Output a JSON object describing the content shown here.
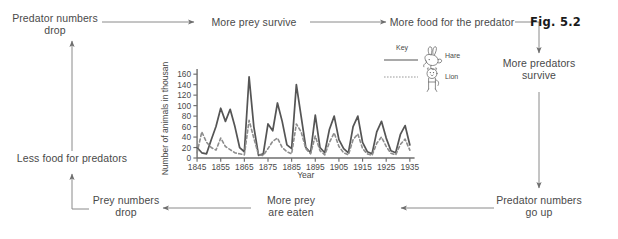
{
  "figure": {
    "label": "Fig. 5.2",
    "caption_type": "predator-prey-cycle-diagram"
  },
  "flow": {
    "nodes": [
      {
        "id": "predator-numbers-drop",
        "label": "Predator numbers\ndrop"
      },
      {
        "id": "more-prey-survive",
        "label": "More prey survive"
      },
      {
        "id": "more-food-for-predator",
        "label": "More food for the predator"
      },
      {
        "id": "more-predators-survive",
        "label": "More predators\nsurvive"
      },
      {
        "id": "predator-numbers-go-up",
        "label": "Predator numbers\ngo up"
      },
      {
        "id": "more-prey-are-eaten",
        "label": "More prey\nare eaten"
      },
      {
        "id": "prey-numbers-drop",
        "label": "Prey numbers\ndrop"
      },
      {
        "id": "less-food-for-predators",
        "label": "Less food for predators"
      }
    ]
  },
  "legend": {
    "title": "Key",
    "entries": [
      {
        "label": "Hare",
        "style": "solid",
        "icon": "hare-illustration",
        "color": "#555555"
      },
      {
        "label": "Lion",
        "style": "dotted",
        "icon": "lion-illustration",
        "color": "#8d8d8d"
      }
    ]
  },
  "chart_data": {
    "type": "line",
    "title": "",
    "xlabel": "Year",
    "ylabel": "Number of animals in thousands",
    "xlim": [
      1845,
      1937
    ],
    "ylim": [
      0,
      170
    ],
    "yticks": [
      0,
      20,
      40,
      60,
      80,
      100,
      120,
      140,
      160
    ],
    "xticks": [
      1845,
      1855,
      1865,
      1875,
      1885,
      1895,
      1905,
      1915,
      1925,
      1935
    ],
    "grid": false,
    "legend_position": "outside-right",
    "x": [
      1845,
      1847,
      1849,
      1851,
      1853,
      1855,
      1857,
      1859,
      1861,
      1863,
      1865,
      1867,
      1869,
      1871,
      1873,
      1875,
      1877,
      1879,
      1881,
      1883,
      1885,
      1887,
      1889,
      1891,
      1893,
      1895,
      1897,
      1899,
      1901,
      1903,
      1905,
      1907,
      1909,
      1911,
      1913,
      1915,
      1917,
      1919,
      1921,
      1923,
      1925,
      1927,
      1929,
      1931,
      1933,
      1935
    ],
    "series": [
      {
        "name": "Hare",
        "style": "solid",
        "values": [
          20,
          10,
          8,
          35,
          60,
          95,
          70,
          93,
          60,
          20,
          12,
          155,
          60,
          5,
          8,
          65,
          52,
          105,
          70,
          25,
          18,
          140,
          80,
          20,
          10,
          82,
          20,
          10,
          55,
          80,
          35,
          18,
          10,
          60,
          80,
          30,
          12,
          8,
          50,
          70,
          38,
          14,
          10,
          45,
          62,
          25
        ]
      },
      {
        "name": "Lion",
        "style": "dotted",
        "values": [
          10,
          50,
          30,
          20,
          15,
          38,
          22,
          16,
          10,
          8,
          6,
          72,
          38,
          6,
          5,
          18,
          32,
          38,
          20,
          12,
          8,
          65,
          50,
          18,
          8,
          42,
          14,
          6,
          30,
          48,
          22,
          10,
          6,
          35,
          46,
          18,
          8,
          5,
          28,
          40,
          22,
          9,
          6,
          26,
          36,
          15
        ]
      }
    ]
  }
}
